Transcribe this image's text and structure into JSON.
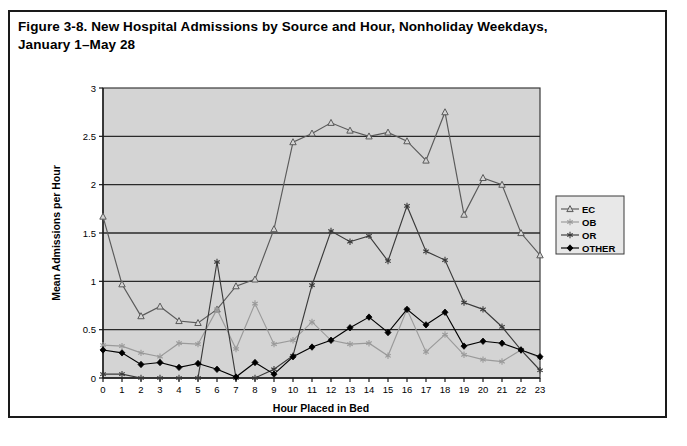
{
  "figure": {
    "title_line1": "Figure 3-8. New Hospital Admissions by Source and Hour, Nonholiday Weekdays,",
    "title_line2": "January 1–May 28"
  },
  "chart_data": {
    "type": "line",
    "title": "Figure 3-8. New Hospital Admissions by Source and Hour, Nonholiday Weekdays, January 1–May 28",
    "xlabel": "Hour Placed in Bed",
    "ylabel": "Mean Admissions per Hour",
    "xlim": [
      0,
      23
    ],
    "ylim": [
      0,
      3
    ],
    "ytick_labels": [
      "0",
      "0.5",
      "1",
      "1.5",
      "2",
      "2.5",
      "3"
    ],
    "ytick_values": [
      0,
      0.5,
      1,
      1.5,
      2,
      2.5,
      3
    ],
    "categories": [
      0,
      1,
      2,
      3,
      4,
      5,
      6,
      7,
      8,
      9,
      10,
      11,
      12,
      13,
      14,
      15,
      16,
      17,
      18,
      19,
      20,
      21,
      22,
      23
    ],
    "xtick_labels": [
      "0",
      "1",
      "2",
      "3",
      "4",
      "5",
      "6",
      "7",
      "8",
      "9",
      "10",
      "11",
      "12",
      "13",
      "14",
      "15",
      "16",
      "17",
      "18",
      "19",
      "20",
      "21",
      "22",
      "23"
    ],
    "grid": true,
    "grid_axis": "y",
    "plot_background": "#d4d4d4",
    "legend_position": "right",
    "series": [
      {
        "name": "EC",
        "marker": "triangle-open",
        "color": "#5a5a5a",
        "values": [
          1.67,
          0.97,
          0.64,
          0.74,
          0.59,
          0.57,
          0.71,
          0.95,
          1.02,
          1.54,
          2.44,
          2.53,
          2.64,
          2.56,
          2.5,
          2.54,
          2.45,
          2.25,
          2.75,
          1.69,
          2.07,
          2.0,
          1.5,
          1.27
        ]
      },
      {
        "name": "OB",
        "marker": "star-light",
        "color": "#9a9a9a",
        "values": [
          0.34,
          0.33,
          0.26,
          0.22,
          0.36,
          0.35,
          0.71,
          0.3,
          0.77,
          0.35,
          0.39,
          0.58,
          0.39,
          0.35,
          0.36,
          0.23,
          0.71,
          0.27,
          0.45,
          0.24,
          0.19,
          0.17,
          0.29,
          0.21
        ]
      },
      {
        "name": "OR",
        "marker": "star-dark",
        "color": "#3a3a3a",
        "values": [
          0.04,
          0.04,
          0.0,
          0.0,
          0.0,
          0.0,
          1.2,
          0.0,
          0.0,
          0.09,
          0.23,
          0.96,
          1.52,
          1.41,
          1.47,
          1.21,
          1.78,
          1.31,
          1.22,
          0.78,
          0.71,
          0.53,
          0.29,
          0.08
        ]
      },
      {
        "name": "OTHER",
        "marker": "diamond-filled",
        "color": "#000000",
        "values": [
          0.29,
          0.26,
          0.14,
          0.16,
          0.11,
          0.15,
          0.09,
          0.01,
          0.16,
          0.04,
          0.22,
          0.32,
          0.39,
          0.52,
          0.63,
          0.47,
          0.71,
          0.55,
          0.68,
          0.33,
          0.38,
          0.36,
          0.29,
          0.22
        ]
      }
    ]
  },
  "legend": {
    "items": [
      {
        "label": "EC"
      },
      {
        "label": "OB"
      },
      {
        "label": "OR"
      },
      {
        "label": "OTHER"
      }
    ]
  }
}
